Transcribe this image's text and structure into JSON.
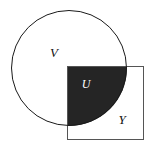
{
  "diagram": {
    "type": "venn-set-diagram",
    "background_color": "#ffffff",
    "stroke_color": "#1a1a1a",
    "shade_color": "#252525",
    "label_color": "#111111",
    "shaded_label_color": "#ffffff",
    "shapes": [
      {
        "name": "circle",
        "label": "V",
        "center_x": 69,
        "center_y": 68,
        "radius": 58,
        "fill": "none",
        "stroke": "#1a1a1a",
        "stroke_width": 1
      },
      {
        "name": "square",
        "label": "Y",
        "left": 67,
        "top": 66,
        "width": 77,
        "height": 74,
        "fill": "none",
        "stroke": "#555555",
        "stroke_width": 1
      }
    ],
    "intersection": {
      "name": "intersection-region",
      "label": "U",
      "fill": "#252525",
      "description": "shaded intersection of circle V and square Y"
    },
    "labels": [
      {
        "text": "V",
        "x": 54,
        "y": 57,
        "font_size": 13,
        "color": "#111111"
      },
      {
        "text": "U",
        "x": 86,
        "y": 88,
        "font_size": 12,
        "color": "#ffffff"
      },
      {
        "text": "Y",
        "x": 122,
        "y": 124,
        "font_size": 13,
        "color": "#111111"
      }
    ]
  }
}
